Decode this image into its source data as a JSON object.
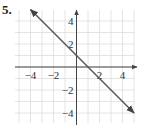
{
  "problem": {
    "number": "5."
  },
  "chart_data": {
    "type": "line",
    "title": "",
    "xlabel": "",
    "ylabel": "",
    "xlim": [
      -5.5,
      5.2
    ],
    "ylim": [
      -5,
      5
    ],
    "grid": true,
    "x_ticks": [
      "-4",
      "-2",
      "2",
      "4"
    ],
    "y_ticks": [
      "4",
      "2",
      "-2",
      "-4"
    ],
    "series": [
      {
        "name": "y = -x + 1",
        "equation": "y = -x + 1",
        "slope": -1,
        "intercept": 1,
        "x": [
          -4,
          5
        ],
        "y": [
          5,
          -4
        ],
        "arrows": "both"
      }
    ],
    "colors": {
      "line": "#555555",
      "grid": "#dddddd",
      "axis": "#444444"
    }
  }
}
